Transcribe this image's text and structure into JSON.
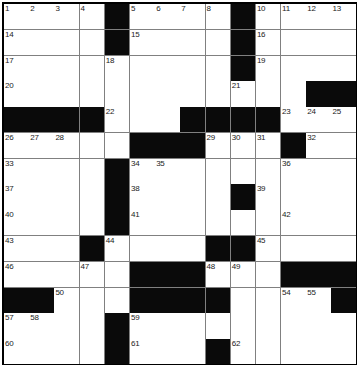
{
  "puzzle": {
    "type": "crossword-grid",
    "rows": 14,
    "columns": 14,
    "cell_size_px": 25,
    "colors": {
      "block": "#0a0a0a",
      "open": "#ffffff",
      "gridline": "#808080",
      "border": "#000000",
      "number_text": "#222222"
    },
    "blocks": [
      [
        0,
        4
      ],
      [
        0,
        9
      ],
      [
        1,
        4
      ],
      [
        1,
        9
      ],
      [
        2,
        9
      ],
      [
        3,
        12
      ],
      [
        3,
        13
      ],
      [
        4,
        0
      ],
      [
        4,
        1
      ],
      [
        4,
        2
      ],
      [
        4,
        3
      ],
      [
        4,
        7
      ],
      [
        4,
        8
      ],
      [
        4,
        9
      ],
      [
        4,
        10
      ],
      [
        5,
        5
      ],
      [
        5,
        6
      ],
      [
        5,
        7
      ],
      [
        5,
        11
      ],
      [
        6,
        4
      ],
      [
        7,
        4
      ],
      [
        7,
        9
      ],
      [
        8,
        4
      ],
      [
        9,
        3
      ],
      [
        9,
        8
      ],
      [
        9,
        9
      ],
      [
        10,
        5
      ],
      [
        10,
        6
      ],
      [
        10,
        7
      ],
      [
        10,
        11
      ],
      [
        10,
        12
      ],
      [
        10,
        13
      ],
      [
        11,
        0
      ],
      [
        11,
        1
      ],
      [
        11,
        5
      ],
      [
        11,
        6
      ],
      [
        11,
        7
      ],
      [
        11,
        8
      ],
      [
        11,
        13
      ],
      [
        12,
        4
      ],
      [
        13,
        4
      ],
      [
        13,
        8
      ]
    ],
    "numbers": [
      {
        "row": 0,
        "col": 0,
        "label": "1"
      },
      {
        "row": 0,
        "col": 1,
        "label": "2"
      },
      {
        "row": 0,
        "col": 2,
        "label": "3"
      },
      {
        "row": 0,
        "col": 3,
        "label": "4"
      },
      {
        "row": 0,
        "col": 5,
        "label": "5"
      },
      {
        "row": 0,
        "col": 6,
        "label": "6"
      },
      {
        "row": 0,
        "col": 7,
        "label": "7"
      },
      {
        "row": 0,
        "col": 8,
        "label": "8"
      },
      {
        "row": 0,
        "col": 9,
        "label": "9"
      },
      {
        "row": 0,
        "col": 10,
        "label": "10"
      },
      {
        "row": 0,
        "col": 11,
        "label": "11"
      },
      {
        "row": 0,
        "col": 12,
        "label": "12"
      },
      {
        "row": 0,
        "col": 13,
        "label": "13"
      },
      {
        "row": 1,
        "col": 0,
        "label": "14"
      },
      {
        "row": 1,
        "col": 5,
        "label": "15"
      },
      {
        "row": 1,
        "col": 10,
        "label": "16"
      },
      {
        "row": 2,
        "col": 0,
        "label": "17"
      },
      {
        "row": 2,
        "col": 4,
        "label": "18"
      },
      {
        "row": 2,
        "col": 10,
        "label": "19"
      },
      {
        "row": 3,
        "col": 0,
        "label": "20"
      },
      {
        "row": 3,
        "col": 9,
        "label": "21"
      },
      {
        "row": 4,
        "col": 4,
        "label": "22"
      },
      {
        "row": 4,
        "col": 11,
        "label": "23"
      },
      {
        "row": 4,
        "col": 12,
        "label": "24"
      },
      {
        "row": 4,
        "col": 13,
        "label": "25"
      },
      {
        "row": 5,
        "col": 0,
        "label": "26"
      },
      {
        "row": 5,
        "col": 1,
        "label": "27"
      },
      {
        "row": 5,
        "col": 2,
        "label": "28"
      },
      {
        "row": 5,
        "col": 8,
        "label": "29"
      },
      {
        "row": 5,
        "col": 9,
        "label": "30"
      },
      {
        "row": 5,
        "col": 10,
        "label": "31"
      },
      {
        "row": 5,
        "col": 12,
        "label": "32"
      },
      {
        "row": 6,
        "col": 0,
        "label": "33"
      },
      {
        "row": 6,
        "col": 5,
        "label": "34"
      },
      {
        "row": 6,
        "col": 6,
        "label": "35"
      },
      {
        "row": 6,
        "col": 11,
        "label": "36"
      },
      {
        "row": 7,
        "col": 0,
        "label": "37"
      },
      {
        "row": 7,
        "col": 5,
        "label": "38"
      },
      {
        "row": 7,
        "col": 10,
        "label": "39"
      },
      {
        "row": 8,
        "col": 0,
        "label": "40"
      },
      {
        "row": 8,
        "col": 5,
        "label": "41"
      },
      {
        "row": 8,
        "col": 11,
        "label": "42"
      },
      {
        "row": 9,
        "col": 0,
        "label": "43"
      },
      {
        "row": 9,
        "col": 4,
        "label": "44"
      },
      {
        "row": 9,
        "col": 10,
        "label": "45"
      },
      {
        "row": 10,
        "col": 0,
        "label": "46"
      },
      {
        "row": 10,
        "col": 3,
        "label": "47"
      },
      {
        "row": 10,
        "col": 8,
        "label": "48"
      },
      {
        "row": 10,
        "col": 9,
        "label": "49"
      },
      {
        "row": 11,
        "col": 2,
        "label": "50"
      },
      {
        "row": 11,
        "col": 5,
        "label": "51"
      },
      {
        "row": 11,
        "col": 6,
        "label": "52"
      },
      {
        "row": 11,
        "col": 7,
        "label": "53"
      },
      {
        "row": 11,
        "col": 11,
        "label": "54"
      },
      {
        "row": 11,
        "col": 12,
        "label": "55"
      },
      {
        "row": 11,
        "col": 13,
        "label": "56"
      },
      {
        "row": 12,
        "col": 0,
        "label": "57"
      },
      {
        "row": 12,
        "col": 1,
        "label": "58"
      },
      {
        "row": 12,
        "col": 5,
        "label": "59"
      },
      {
        "row": 13,
        "col": 0,
        "label": "60"
      },
      {
        "row": 13,
        "col": 5,
        "label": "61"
      },
      {
        "row": 13,
        "col": 9,
        "label": "62"
      }
    ],
    "extra_numbers_bottom": [
      {
        "row": 14,
        "col": 0,
        "label": "63"
      },
      {
        "row": 14,
        "col": 5,
        "label": "64"
      },
      {
        "row": 14,
        "col": 9,
        "label": "65"
      }
    ],
    "letters": []
  }
}
